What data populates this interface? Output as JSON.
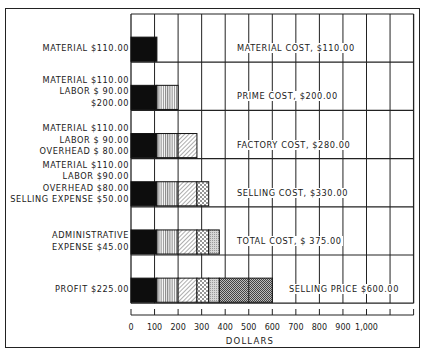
{
  "chart_data": {
    "type": "bar",
    "orientation": "horizontal-stacked",
    "title": "",
    "xlabel": "DOLLARS",
    "ylabel": "",
    "xlim": [
      0,
      1200
    ],
    "x_ticks": [
      "0",
      "100",
      "200",
      "300",
      "400",
      "500",
      "600",
      "700",
      "800",
      "900",
      "1,000",
      ""
    ],
    "grid": true,
    "segments_legend": [
      {
        "name": "Material",
        "value": 110,
        "pattern": "solid-black"
      },
      {
        "name": "Labor",
        "value": 90,
        "pattern": "vertical-lines"
      },
      {
        "name": "Overhead",
        "value": 80,
        "pattern": "diagonal-lines"
      },
      {
        "name": "Selling Expense",
        "value": 50,
        "pattern": "dots"
      },
      {
        "name": "Administrative Expense",
        "value": 45,
        "pattern": "stipple"
      },
      {
        "name": "Profit",
        "value": 225,
        "pattern": "crosshatch"
      }
    ],
    "rows": [
      {
        "left_label": [
          "MATERIAL $110.00"
        ],
        "right_label": "MATERIAL COST, $110.00",
        "segments": [
          110
        ],
        "total": 110
      },
      {
        "left_label": [
          "MATERIAL $110.00",
          "LABOR $ 90.00",
          "$200.00"
        ],
        "right_label": "PRIME COST, $200.00",
        "segments": [
          110,
          90
        ],
        "total": 200
      },
      {
        "left_label": [
          "MATERIAL $110.00",
          "LABOR $ 90.00",
          "OVERHEAD $ 80.00"
        ],
        "right_label": "FACTORY COST, $280.00",
        "segments": [
          110,
          90,
          80
        ],
        "total": 280
      },
      {
        "left_label": [
          "MATERIAL $110.00",
          "LABOR $90.00",
          "OVERHEAD $80.00",
          "SELLING EXPENSE $50.00"
        ],
        "right_label": "SELLING COST, $330.00",
        "segments": [
          110,
          90,
          80,
          50
        ],
        "total": 330
      },
      {
        "left_label": [
          "ADMINISTRATIVE",
          "EXPENSE $45.00"
        ],
        "right_label": "TOTAL COST, $ 375.00",
        "segments": [
          110,
          90,
          80,
          50,
          45
        ],
        "total": 375
      },
      {
        "left_label": [
          "PROFIT $225.00"
        ],
        "right_label": "SELLING PRICE $600.00",
        "segments": [
          110,
          90,
          80,
          50,
          45,
          225
        ],
        "total": 600
      }
    ]
  }
}
